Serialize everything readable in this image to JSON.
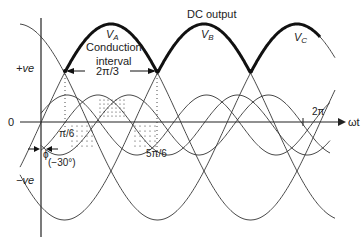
{
  "diagram": {
    "title": "DC output",
    "phase_labels": {
      "a": "V",
      "a_sub": "A",
      "b": "V",
      "b_sub": "B",
      "c": "V",
      "c_sub": "C"
    },
    "conduction_label_1": "Conduction",
    "conduction_label_2": "interval",
    "conduction_value": "2π/3",
    "y_labels": {
      "pos": "+ve",
      "zero": "0",
      "neg": "−ve"
    },
    "x_axis_label": "ωt",
    "x_marks": {
      "pi6": "π/6",
      "five_pi6": "5π/6",
      "two_pi": "2π"
    },
    "phi_label": "ϕ",
    "phi_value": "(−30°)",
    "colors": {
      "line": "#222222",
      "bold": "#111111",
      "background": "#ffffff"
    }
  }
}
